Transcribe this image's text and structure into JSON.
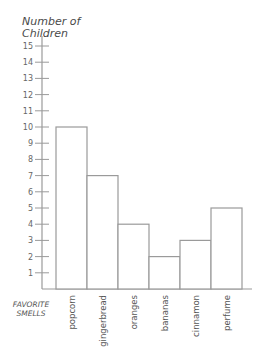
{
  "chart_data": {
    "type": "bar",
    "title": "",
    "ylabel": "Number of Children",
    "xlabel": "FAVORITE SMELLS",
    "categories": [
      "popcorn",
      "gingerbread",
      "oranges",
      "bananas",
      "cinnamon",
      "perfume"
    ],
    "values": [
      10,
      7,
      4,
      2,
      3,
      5
    ],
    "ylim": [
      0,
      15
    ],
    "yticks": [
      1,
      2,
      3,
      4,
      5,
      6,
      7,
      8,
      9,
      10,
      11,
      12,
      13,
      14,
      15
    ],
    "grid": false,
    "legend": null
  },
  "labels": {
    "ylabel_line1": "Number of",
    "ylabel_line2": "Children",
    "xlabel_line1": "FAVORITE",
    "xlabel_line2": "SMELLS"
  },
  "colors": {
    "bar_stroke": "#9a9a9a",
    "bar_fill": "#ffffff",
    "axis": "#9a9a9a"
  }
}
